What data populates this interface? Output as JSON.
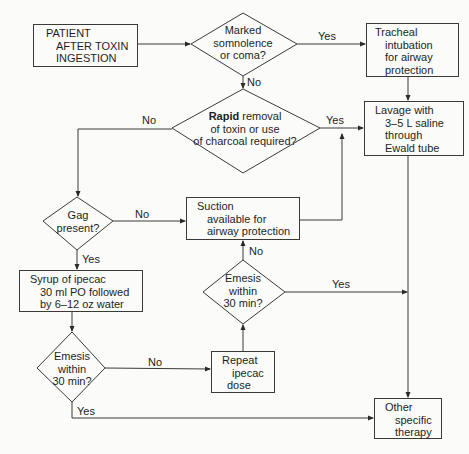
{
  "flowchart": {
    "start": {
      "lines": [
        "PATIENT",
        "AFTER TOXIN",
        "INGESTION"
      ]
    },
    "decision_somnolence": {
      "lines": [
        "Marked",
        "somnolence",
        "or coma?"
      ]
    },
    "tracheal_intubation": {
      "lines": [
        "Tracheal",
        "intubation",
        "for airway",
        "protection"
      ]
    },
    "decision_rapid": {
      "bold": "Rapid",
      "line1_rest": " removal",
      "line2": "of toxin or use",
      "line3": "of charcoal required?"
    },
    "lavage": {
      "lines": [
        "Lavage with",
        "3–5 L saline",
        "through",
        "Ewald tube"
      ]
    },
    "decision_gag": {
      "lines": [
        "Gag",
        "present?"
      ]
    },
    "suction": {
      "lines": [
        "Suction",
        "available for",
        "airway protection"
      ]
    },
    "syrup_ipecac": {
      "lines": [
        "Syrup of ipecac",
        "30 ml PO followed",
        "by 6–12 oz water"
      ]
    },
    "decision_emesis_right": {
      "lines": [
        "Emesis",
        "within",
        "30 min?"
      ]
    },
    "decision_emesis_left": {
      "lines": [
        "Emesis",
        "within",
        "30 min?"
      ]
    },
    "repeat_ipecac": {
      "lines": [
        "Repeat",
        "ipecac",
        "dose"
      ]
    },
    "other_therapy": {
      "lines": [
        "Other",
        "specific",
        "therapy"
      ]
    },
    "edge_labels": {
      "somnolence_yes": "Yes",
      "somnolence_no": "No",
      "rapid_no": "No",
      "rapid_yes": "Yes",
      "gag_no": "No",
      "gag_yes": "Yes",
      "emesis_right_no": "No",
      "emesis_right_yes": "Yes",
      "emesis_left_no": "No",
      "emesis_left_yes": "Yes"
    },
    "colors": {
      "background": "#fbfbf9",
      "stroke": "#3a3a3a",
      "text": "#1e1e1e"
    }
  }
}
